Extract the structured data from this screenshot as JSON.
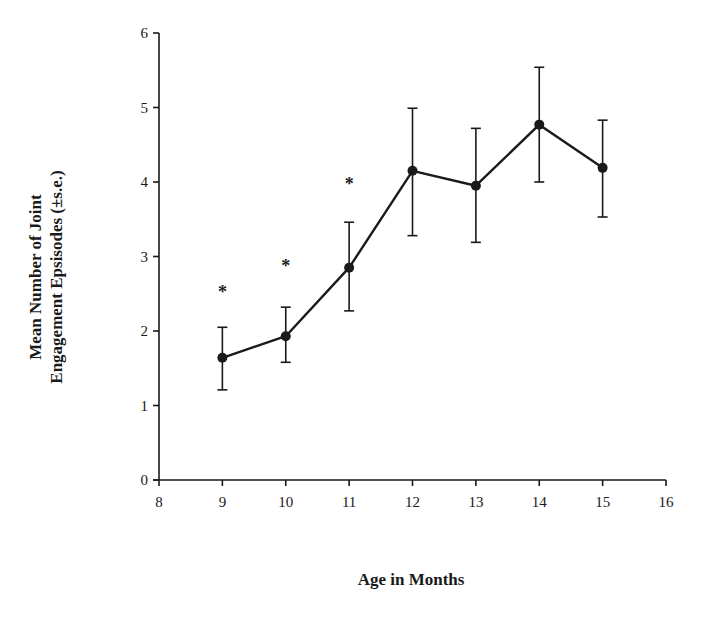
{
  "chart_data": {
    "type": "line",
    "title": "",
    "xlabel": "Age in Months",
    "ylabel_lines": [
      "Mean Number of Joint",
      "Engagement Epsisodes (±s.e.)"
    ],
    "ylabel": "Mean Number of Joint Engagement Epsisodes (±s.e.)",
    "xlim": [
      8,
      16
    ],
    "ylim": [
      0,
      6
    ],
    "x_ticks": [
      8,
      9,
      10,
      11,
      12,
      13,
      14,
      15,
      16
    ],
    "y_ticks": [
      0,
      1,
      2,
      3,
      4,
      5,
      6
    ],
    "grid": false,
    "legend": null,
    "series": [
      {
        "name": "Joint Engagement Episodes",
        "x": [
          9,
          10,
          11,
          12,
          13,
          14,
          15
        ],
        "values": [
          1.64,
          1.93,
          2.85,
          4.15,
          3.95,
          4.77,
          4.19
        ],
        "error_upper": [
          2.05,
          2.32,
          3.46,
          4.99,
          4.72,
          5.54,
          4.83
        ],
        "error_lower": [
          1.21,
          1.58,
          2.27,
          3.28,
          3.19,
          4.0,
          3.53
        ],
        "marker": "filled-circle",
        "color": "#1a1a1a"
      }
    ],
    "annotations": [
      {
        "x": 9,
        "y": 2.55,
        "text": "*"
      },
      {
        "x": 10,
        "y": 2.9,
        "text": "*"
      },
      {
        "x": 11,
        "y": 4.0,
        "text": "*"
      }
    ]
  }
}
